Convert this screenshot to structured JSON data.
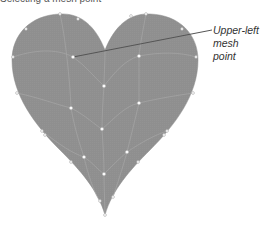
{
  "caption": "Selecting a mesh point",
  "callout": {
    "line1": "Upper-left",
    "line2": "mesh point"
  },
  "colors": {
    "fill": "#8f8f8f",
    "mesh_line": "#a8a8a8",
    "point_fill": "#ffffff",
    "leader_line": "#555555"
  },
  "shape": "heart"
}
